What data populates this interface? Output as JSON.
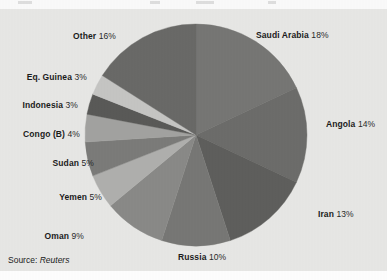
{
  "figure": {
    "background_color": "#e8e8e6",
    "page_color": "#ffffff",
    "title_remnant_present": true
  },
  "source": {
    "prefix": "Source:",
    "value": "Reuters"
  },
  "chart_data": {
    "type": "pie",
    "title": "",
    "subtitle": "",
    "xlabel": "",
    "ylabel": "",
    "legend_position": "none",
    "grid": false,
    "label_format": "{name} {value}%",
    "start_angle_deg": 0,
    "direction": "clockwise",
    "categories": [
      "Saudi Arabia",
      "Angola",
      "Iran",
      "Russia",
      "Oman",
      "Yemen",
      "Sudan",
      "Congo (B)",
      "Indonesia",
      "Eq. Guinea",
      "Other"
    ],
    "values": [
      18,
      14,
      13,
      10,
      9,
      5,
      5,
      4,
      3,
      3,
      16
    ],
    "slices": [
      {
        "name": "Saudi Arabia",
        "value": 18,
        "pct_text": "18%",
        "color": "#777775",
        "label_side": "right"
      },
      {
        "name": "Angola",
        "value": 14,
        "pct_text": "14%",
        "color": "#6d6d6b",
        "label_side": "right"
      },
      {
        "name": "Iran",
        "value": 13,
        "pct_text": "13%",
        "color": "#5f5f5d",
        "label_side": "right"
      },
      {
        "name": "Russia",
        "value": 10,
        "pct_text": "10%",
        "color": "#787876",
        "label_side": "center"
      },
      {
        "name": "Oman",
        "value": 9,
        "pct_text": "9%",
        "color": "#8a8a88",
        "label_side": "left"
      },
      {
        "name": "Yemen",
        "value": 5,
        "pct_text": "5%",
        "color": "#b0b0ae",
        "label_side": "left"
      },
      {
        "name": "Sudan",
        "value": 5,
        "pct_text": "5%",
        "color": "#7c7c7a",
        "label_side": "left"
      },
      {
        "name": "Congo (B)",
        "value": 4,
        "pct_text": "4%",
        "color": "#a3a3a1",
        "label_side": "left"
      },
      {
        "name": "Indonesia",
        "value": 3,
        "pct_text": "3%",
        "color": "#5a5a58",
        "label_side": "left"
      },
      {
        "name": "Eq. Guinea",
        "value": 3,
        "pct_text": "3%",
        "color": "#c6c6c4",
        "label_side": "left"
      },
      {
        "name": "Other",
        "value": 16,
        "pct_text": "16%",
        "color": "#6a6a68",
        "label_side": "center"
      }
    ]
  },
  "labels": {
    "saudi_arabia": {
      "name": "Saudi Arabia",
      "pct": "18%"
    },
    "angola": {
      "name": "Angola",
      "pct": "14%"
    },
    "iran": {
      "name": "Iran",
      "pct": "13%"
    },
    "russia": {
      "name": "Russia",
      "pct": "10%"
    },
    "oman": {
      "name": "Oman",
      "pct": "9%"
    },
    "yemen": {
      "name": "Yemen",
      "pct": "5%"
    },
    "sudan": {
      "name": "Sudan",
      "pct": "5%"
    },
    "congo": {
      "name": "Congo (B)",
      "pct": "4%"
    },
    "indonesia": {
      "name": "Indonesia",
      "pct": "3%"
    },
    "eq_guinea": {
      "name": "Eq. Guinea",
      "pct": "3%"
    },
    "other": {
      "name": "Other",
      "pct": "16%"
    }
  }
}
